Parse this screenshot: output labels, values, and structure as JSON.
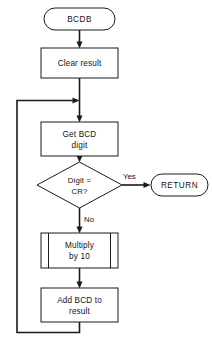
{
  "diagram": {
    "title": "BCDB",
    "type": "flowchart",
    "nodes": {
      "start": {
        "id": "start",
        "shape": "terminal",
        "label": "BCDB"
      },
      "clear": {
        "id": "clear",
        "shape": "process",
        "label": "Clear result"
      },
      "getdigit": {
        "id": "getdigit",
        "shape": "process",
        "line1": "Get BCD",
        "line2": "digit"
      },
      "decision": {
        "id": "decision",
        "shape": "decision",
        "line1": "Digit =",
        "line2": "CR?"
      },
      "multiply": {
        "id": "multiply",
        "shape": "predefined-process",
        "line1": "Multiply",
        "line2": "by 10"
      },
      "addbcd": {
        "id": "addbcd",
        "shape": "process",
        "line1": "Add BCD to",
        "line2": "result"
      },
      "return": {
        "id": "return",
        "shape": "terminal",
        "label": "RETURN"
      }
    },
    "branch_labels": {
      "yes": "Yes",
      "no": "No"
    },
    "colors": {
      "stroke": "#1a1a1a",
      "fill": "#ffffff",
      "text": "#141414",
      "background": "#ffffff"
    }
  }
}
